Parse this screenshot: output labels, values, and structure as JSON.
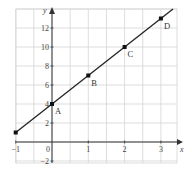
{
  "chart_data": {
    "type": "line",
    "title": "",
    "xlabel": "x",
    "ylabel": "y",
    "xlim": [
      -1,
      3.45
    ],
    "ylim": [
      -2.2,
      14
    ],
    "grid": true,
    "x_ticks": [
      -1,
      0,
      1,
      2,
      3
    ],
    "y_ticks": [
      -2,
      2,
      4,
      6,
      8,
      10,
      12
    ],
    "origin_label": "0",
    "series": [
      {
        "name": "y = 3x + 4",
        "x": [
          -1,
          0,
          1,
          2,
          3
        ],
        "y": [
          1,
          4,
          7,
          10,
          13
        ]
      }
    ],
    "points": [
      {
        "label": "",
        "x": -1,
        "y": 1
      },
      {
        "label": "A",
        "x": 0,
        "y": 4
      },
      {
        "label": "B",
        "x": 1,
        "y": 7
      },
      {
        "label": "C",
        "x": 2,
        "y": 10
      },
      {
        "label": "D",
        "x": 3,
        "y": 13
      }
    ],
    "colors": {
      "grid": "#d4d4d4",
      "axis": "#333333",
      "line": "#222222",
      "point": "#111111"
    }
  }
}
